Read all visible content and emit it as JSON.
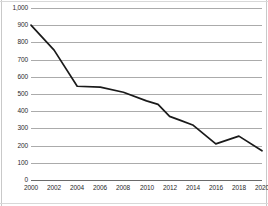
{
  "chart_data": {
    "type": "line",
    "title": "",
    "subtitle": "",
    "xlabel": "",
    "ylabel": "",
    "xlim": [
      2000,
      2020
    ],
    "ylim": [
      0,
      1000
    ],
    "grid": true,
    "grid_axis": "y",
    "legend": false,
    "legend_position": "none",
    "line_color": "#1a1a1a",
    "grid_color": "#8f8f8f",
    "background_color": "#ffffff",
    "x_tick_labels": [
      "2000",
      "2002",
      "2004",
      "2006",
      "2008",
      "2010",
      "2012",
      "2014",
      "2016",
      "2018",
      "2020"
    ],
    "x_tick_values": [
      2000,
      2002,
      2004,
      2006,
      2008,
      2010,
      2012,
      2014,
      2016,
      2018,
      2020
    ],
    "y_tick_labels": [
      "1,000",
      "900",
      "800",
      "700",
      "600",
      "500",
      "400",
      "300",
      "200",
      "100",
      "0"
    ],
    "y_tick_values": [
      1000,
      900,
      800,
      700,
      600,
      500,
      400,
      300,
      200,
      100,
      0
    ],
    "series": [
      {
        "name": "series-1",
        "x": [
          2000,
          2002,
          2004,
          2006,
          2008,
          2010,
          2011,
          2012,
          2013,
          2014,
          2016,
          2018,
          2020
        ],
        "values": [
          900,
          755,
          545,
          540,
          510,
          460,
          440,
          370,
          345,
          320,
          210,
          255,
          170
        ]
      }
    ]
  }
}
